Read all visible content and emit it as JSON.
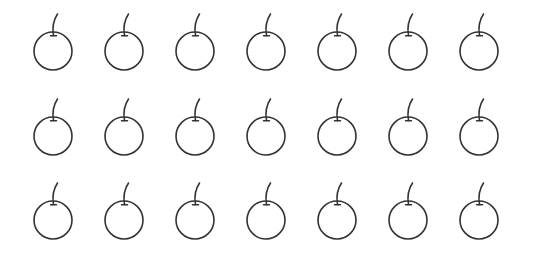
{
  "scene": {
    "description": "Grid of hand-drawn apple outlines",
    "rows": 3,
    "columns": 7,
    "total_count": 21,
    "icon": "apple-outline-icon",
    "stroke_color": "#333333",
    "background_color": "#ffffff",
    "column_centers_x": [
      53,
      124,
      195,
      266,
      337,
      408,
      479
    ],
    "row_centers_y": [
      51,
      136,
      220
    ],
    "radius": 19
  }
}
